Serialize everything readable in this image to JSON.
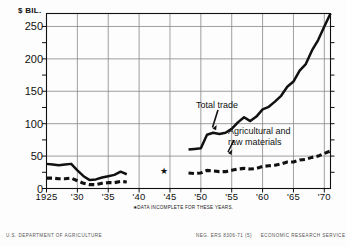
{
  "figure": {
    "y_axis_unit": "$ BIL.",
    "footnote": "★DATA INCOMPLETE FOR THESE YEARS.",
    "credit_left": "U.S. DEPARTMENT OF AGRICULTURE",
    "credit_neg": "NEG. ERS 8306-71 (5)",
    "credit_right": "ECONOMIC RESEARCH SERVICE",
    "label_total": "Total trade",
    "label_ag_line1": "Agricultural and",
    "label_ag_line2": "raw materials",
    "incomplete_marker": "★"
  },
  "chart_data": {
    "type": "line",
    "title": "",
    "xlabel": "",
    "ylabel": "$ BIL.",
    "xlim": [
      1925,
      1971
    ],
    "ylim": [
      0,
      270
    ],
    "yticks": [
      0,
      50,
      100,
      150,
      200,
      250
    ],
    "ytick_labels": [
      "0",
      "50",
      "100",
      "150",
      "200",
      "250"
    ],
    "yminor": [
      25,
      75,
      125,
      175,
      225
    ],
    "xticks": [
      1925,
      1930,
      1935,
      1940,
      1945,
      1950,
      1955,
      1960,
      1965,
      1970
    ],
    "xtick_labels": [
      "1925",
      "'30",
      "'35",
      "'40",
      "'45",
      "'50",
      "'55",
      "'60",
      "'65",
      "'70"
    ],
    "grid": true,
    "legend_position": "inline-annotations",
    "annotations": [
      {
        "text": "Total trade",
        "x": 1953,
        "y": 132
      },
      {
        "text": "Agricultural and raw materials",
        "x": 1958,
        "y": 100
      },
      {
        "text": "★",
        "x": 1944,
        "y": 28,
        "note": "DATA INCOMPLETE FOR THESE YEARS."
      }
    ],
    "series": [
      {
        "name": "Total trade",
        "style": "solid",
        "color": "#111111",
        "segments": [
          {
            "x": [
              1925,
              1926,
              1927,
              1928,
              1929,
              1930,
              1931,
              1932,
              1933,
              1934,
              1935,
              1936,
              1937,
              1938
            ],
            "values": [
              38,
              37,
              36,
              37,
              38,
              28,
              19,
              13,
              14,
              17,
              19,
              21,
              26,
              22
            ]
          },
          {
            "x": [
              1948,
              1949,
              1950,
              1951,
              1952,
              1953,
              1954,
              1955,
              1956,
              1957,
              1958,
              1959,
              1960,
              1961,
              1962,
              1963,
              1964,
              1965,
              1966,
              1967,
              1968,
              1969,
              1970,
              1971
            ],
            "values": [
              60,
              61,
              62,
              83,
              86,
              84,
              86,
              92,
              102,
              110,
              104,
              111,
              122,
              126,
              134,
              143,
              157,
              165,
              182,
              192,
              213,
              229,
              250,
              270
            ]
          }
        ]
      },
      {
        "name": "Agricultural and raw materials",
        "style": "dashed",
        "color": "#111111",
        "segments": [
          {
            "x": [
              1925,
              1926,
              1927,
              1928,
              1929,
              1930,
              1931,
              1932,
              1933,
              1934,
              1935,
              1936,
              1937,
              1938
            ],
            "values": [
              16,
              16,
              15,
              15,
              16,
              12,
              8,
              6,
              6,
              8,
              9,
              9,
              11,
              10
            ]
          },
          {
            "x": [
              1948,
              1949,
              1950,
              1951,
              1952,
              1953,
              1954,
              1955,
              1956,
              1957,
              1958,
              1959,
              1960,
              1961,
              1962,
              1963,
              1964,
              1965,
              1966,
              1967,
              1968,
              1969,
              1970,
              1971
            ],
            "values": [
              24,
              23,
              24,
              28,
              27,
              26,
              26,
              28,
              30,
              31,
              30,
              31,
              34,
              35,
              36,
              38,
              41,
              41,
              44,
              45,
              48,
              50,
              54,
              58
            ]
          }
        ]
      }
    ]
  }
}
